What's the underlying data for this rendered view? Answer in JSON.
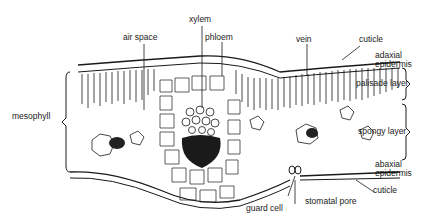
{
  "labels": {
    "xylem": "xylem",
    "air_space": "air space",
    "phloem": "phloem",
    "vein": "vein",
    "cuticle_top": "cuticle",
    "adaxial_epidermis_1": "adaxial",
    "adaxial_epidermis_2": "epidermis",
    "palisade_layer": "palisade layer",
    "mesophyll": "mesophyll",
    "spongy_layer": "spongy layer",
    "abaxial_epidermis_1": "abaxial",
    "abaxial_epidermis_2": "epidermis",
    "cuticle_bottom": "cuticle",
    "stomatal_pore": "stomatal pore",
    "guard_cell": "guard cell"
  },
  "colors": {
    "ink": "#1a1a1a",
    "background": "#ffffff"
  }
}
